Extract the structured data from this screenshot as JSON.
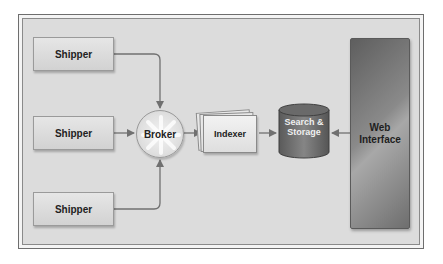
{
  "diagram": {
    "type": "architecture-flow",
    "nodes": {
      "shippers": [
        {
          "label": "Shipper"
        },
        {
          "label": "Shipper"
        },
        {
          "label": "Shipper"
        }
      ],
      "broker": {
        "label": "Broker"
      },
      "indexer": {
        "label": "Indexer"
      },
      "storage": {
        "line1": "Search &",
        "line2": "Storage"
      },
      "web": {
        "line1": "Web",
        "line2": "Interface"
      }
    },
    "edges": [
      {
        "from": "Shipper (top)",
        "to": "Broker"
      },
      {
        "from": "Shipper (middle)",
        "to": "Broker"
      },
      {
        "from": "Shipper (bottom)",
        "to": "Broker"
      },
      {
        "from": "Broker",
        "to": "Indexer"
      },
      {
        "from": "Indexer",
        "to": "Search & Storage"
      },
      {
        "from": "Web Interface",
        "to": "Search & Storage"
      }
    ],
    "colors": {
      "panel": "#dcdcdc",
      "storage": "#7a7a7a",
      "web": "#8a8a8a",
      "line": "#707070"
    }
  }
}
